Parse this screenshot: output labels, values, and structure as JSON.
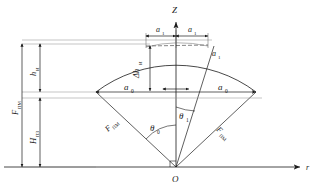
{
  "figure": {
    "title_axes": {
      "vertical_axis": "Z",
      "horizontal_axis": "r",
      "origin": "O"
    },
    "labels": {
      "a1_left": "a",
      "a1_left_sub": "1",
      "a1_right": "a",
      "a1_right_sub": "1",
      "a1_arc": "a",
      "a1_arc_sub": "1",
      "a0_left": "a",
      "a0_left_sub": "0",
      "a0_right": "a",
      "a0_right_sub": "0",
      "delta_h": "Δh",
      "delta_h_sub": "И",
      "h_i": "h",
      "h_i_sub": "И",
      "H_pz": "H",
      "H_pz_sub": "ПЗ",
      "F_pm_outer": "F",
      "F_pm_outer_sub": "ПМ",
      "F_pm_left": "F",
      "F_pm_left_sub": "ПМ",
      "F_pm_right": "F",
      "F_pm_right_sub": "ПМ",
      "theta_0": "θ",
      "theta_0_sub": "0",
      "theta_1": "θ",
      "theta_1_sub": "1"
    },
    "colors": {
      "line": "#1a1a1a",
      "thin_line": "#555555",
      "background": "#ffffff",
      "dashed": "#333333"
    },
    "geometry": {
      "origin_x": 176,
      "origin_y": 167,
      "radius_outer": 133,
      "radius_inner_chord_y": 91,
      "apex_y": 44,
      "theta_0_deg": 37,
      "theta_1_deg": 16
    }
  }
}
